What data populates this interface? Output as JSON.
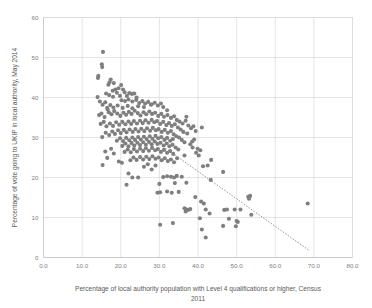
{
  "chart_data": {
    "type": "scatter",
    "title": "",
    "xlabel": "Percentage of local authority population with Level 4 qualifications or higher, Census 2011",
    "xlabel_line1": "Percentage of local authority population with Level 4 qualifications or higher, Census",
    "xlabel_line2": "2011",
    "ylabel": "Percentage of vote going to UKIP in local authority, May 2014",
    "xlim": [
      0,
      80
    ],
    "ylim": [
      0,
      60
    ],
    "xticks": [
      0,
      10,
      20,
      30,
      40,
      50,
      60,
      70,
      80
    ],
    "xtick_labels": [
      "0.0",
      "10.0",
      "20.0",
      "30.0",
      "40.0",
      "50.0",
      "60.0",
      "70.0",
      "80.0"
    ],
    "yticks": [
      0,
      10,
      20,
      30,
      40,
      50,
      60
    ],
    "ytick_labels": [
      "0",
      "10",
      "20",
      "30",
      "40",
      "50",
      "60"
    ],
    "grid": true,
    "legend": false,
    "marker_color": "#7f7f7f",
    "marker_size": 3.2,
    "trendline": {
      "style": "dotted",
      "color": "#808080",
      "x_start": 31.6,
      "y_start": 27.3,
      "x_end": 69.0,
      "y_end": 1.6
    },
    "series": [
      {
        "name": "Local authorities",
        "points": [
          [
            15.4,
            51.4
          ],
          [
            15.1,
            48.3
          ],
          [
            15.2,
            47.6
          ],
          [
            14.2,
            45.4
          ],
          [
            14.1,
            44.9
          ],
          [
            17.4,
            44.5
          ],
          [
            17.1,
            43.8
          ],
          [
            16.8,
            43.2
          ],
          [
            18.2,
            43.6
          ],
          [
            18.6,
            42.0
          ],
          [
            17.9,
            41.7
          ],
          [
            19.4,
            42.3
          ],
          [
            20.1,
            43.1
          ],
          [
            20.6,
            42.0
          ],
          [
            19.0,
            41.2
          ],
          [
            16.2,
            41.0
          ],
          [
            17.0,
            40.6
          ],
          [
            18.0,
            40.2
          ],
          [
            19.8,
            40.4
          ],
          [
            21.0,
            41.3
          ],
          [
            21.6,
            40.4
          ],
          [
            22.2,
            41.1
          ],
          [
            22.9,
            40.9
          ],
          [
            23.5,
            41.0
          ],
          [
            24.1,
            40.0
          ],
          [
            20.2,
            39.3
          ],
          [
            21.1,
            39.1
          ],
          [
            22.0,
            39.5
          ],
          [
            23.0,
            39.0
          ],
          [
            24.0,
            39.4
          ],
          [
            24.8,
            38.6
          ],
          [
            25.6,
            39.1
          ],
          [
            26.3,
            38.5
          ],
          [
            27.1,
            38.9
          ],
          [
            28.0,
            38.3
          ],
          [
            28.8,
            38.7
          ],
          [
            29.6,
            38.0
          ],
          [
            30.4,
            38.5
          ],
          [
            31.0,
            37.6
          ],
          [
            32.0,
            36.8
          ],
          [
            14.0,
            40.1
          ],
          [
            14.6,
            39.0
          ],
          [
            15.3,
            38.2
          ],
          [
            16.0,
            38.8
          ],
          [
            16.5,
            37.4
          ],
          [
            15.0,
            36.0
          ],
          [
            14.4,
            35.6
          ],
          [
            15.8,
            35.1
          ],
          [
            16.9,
            36.3
          ],
          [
            17.6,
            35.8
          ],
          [
            18.3,
            36.6
          ],
          [
            19.1,
            36.0
          ],
          [
            19.9,
            35.4
          ],
          [
            20.7,
            36.2
          ],
          [
            21.4,
            35.7
          ],
          [
            22.1,
            36.4
          ],
          [
            22.8,
            35.9
          ],
          [
            23.6,
            36.7
          ],
          [
            24.4,
            36.1
          ],
          [
            25.1,
            35.5
          ],
          [
            25.9,
            36.3
          ],
          [
            26.6,
            35.8
          ],
          [
            27.4,
            36.5
          ],
          [
            28.1,
            35.9
          ],
          [
            28.9,
            36.2
          ],
          [
            29.7,
            35.4
          ],
          [
            30.5,
            35.9
          ],
          [
            31.2,
            35.2
          ],
          [
            32.1,
            35.6
          ],
          [
            33.0,
            34.9
          ],
          [
            33.8,
            35.3
          ],
          [
            34.5,
            34.4
          ],
          [
            35.2,
            34.0
          ],
          [
            36.0,
            33.5
          ],
          [
            36.8,
            34.2
          ],
          [
            37.5,
            33.0
          ],
          [
            38.2,
            32.3
          ],
          [
            37.0,
            35.2
          ],
          [
            38.8,
            32.8
          ],
          [
            39.4,
            31.6
          ],
          [
            14.8,
            33.4
          ],
          [
            15.6,
            33.9
          ],
          [
            16.3,
            32.8
          ],
          [
            17.2,
            33.5
          ],
          [
            18.0,
            32.9
          ],
          [
            18.8,
            33.8
          ],
          [
            19.6,
            33.2
          ],
          [
            20.4,
            33.9
          ],
          [
            21.2,
            33.3
          ],
          [
            22.0,
            34.0
          ],
          [
            22.7,
            33.4
          ],
          [
            23.4,
            34.1
          ],
          [
            24.2,
            33.5
          ],
          [
            25.0,
            34.2
          ],
          [
            25.7,
            33.6
          ],
          [
            26.4,
            34.3
          ],
          [
            27.2,
            33.7
          ],
          [
            28.0,
            34.4
          ],
          [
            28.7,
            33.8
          ],
          [
            29.4,
            34.1
          ],
          [
            30.2,
            33.4
          ],
          [
            31.0,
            33.9
          ],
          [
            31.8,
            33.1
          ],
          [
            32.5,
            33.6
          ],
          [
            33.2,
            32.9
          ],
          [
            34.0,
            33.3
          ],
          [
            34.8,
            32.5
          ],
          [
            35.5,
            32.0
          ],
          [
            36.2,
            31.4
          ],
          [
            37.2,
            31.0
          ],
          [
            15.2,
            30.1
          ],
          [
            16.1,
            31.2
          ],
          [
            17.0,
            30.6
          ],
          [
            17.8,
            31.5
          ],
          [
            18.5,
            30.9
          ],
          [
            19.3,
            31.8
          ],
          [
            20.0,
            31.1
          ],
          [
            20.8,
            31.9
          ],
          [
            21.5,
            31.3
          ],
          [
            22.3,
            32.0
          ],
          [
            23.1,
            31.4
          ],
          [
            23.8,
            32.1
          ],
          [
            24.6,
            31.5
          ],
          [
            25.3,
            32.2
          ],
          [
            26.1,
            31.6
          ],
          [
            26.8,
            32.3
          ],
          [
            27.6,
            31.7
          ],
          [
            28.3,
            32.4
          ],
          [
            29.1,
            31.8
          ],
          [
            29.8,
            32.1
          ],
          [
            30.6,
            31.4
          ],
          [
            31.4,
            31.9
          ],
          [
            32.2,
            31.2
          ],
          [
            33.0,
            31.6
          ],
          [
            33.7,
            30.8
          ],
          [
            34.4,
            30.3
          ],
          [
            35.1,
            30.0
          ],
          [
            35.8,
            29.4
          ],
          [
            36.5,
            28.8
          ],
          [
            38.0,
            28.3
          ],
          [
            19.0,
            29.2
          ],
          [
            19.8,
            29.8
          ],
          [
            20.6,
            29.1
          ],
          [
            21.4,
            29.9
          ],
          [
            22.2,
            29.3
          ],
          [
            23.0,
            30.0
          ],
          [
            23.7,
            29.4
          ],
          [
            24.5,
            30.1
          ],
          [
            25.2,
            29.5
          ],
          [
            26.0,
            30.2
          ],
          [
            26.7,
            29.6
          ],
          [
            27.5,
            30.3
          ],
          [
            28.2,
            29.7
          ],
          [
            29.0,
            30.4
          ],
          [
            29.7,
            29.8
          ],
          [
            30.5,
            30.1
          ],
          [
            31.3,
            29.4
          ],
          [
            32.0,
            29.9
          ],
          [
            32.8,
            29.2
          ],
          [
            33.5,
            29.6
          ],
          [
            20.4,
            27.9
          ],
          [
            21.2,
            28.5
          ],
          [
            22.0,
            27.8
          ],
          [
            22.8,
            28.6
          ],
          [
            23.5,
            28.0
          ],
          [
            24.3,
            28.7
          ],
          [
            25.0,
            28.1
          ],
          [
            25.8,
            28.8
          ],
          [
            26.5,
            28.2
          ],
          [
            27.3,
            28.9
          ],
          [
            28.0,
            28.3
          ],
          [
            28.8,
            29.0
          ],
          [
            29.5,
            28.4
          ],
          [
            30.3,
            28.7
          ],
          [
            31.1,
            28.0
          ],
          [
            31.9,
            28.5
          ],
          [
            32.6,
            27.8
          ],
          [
            33.4,
            28.2
          ],
          [
            34.2,
            27.5
          ],
          [
            34.9,
            27.0
          ],
          [
            16.0,
            26.5
          ],
          [
            17.5,
            27.2
          ],
          [
            18.2,
            26.0
          ],
          [
            21.0,
            26.4
          ],
          [
            21.8,
            27.0
          ],
          [
            22.6,
            26.3
          ],
          [
            23.4,
            27.1
          ],
          [
            24.2,
            26.5
          ],
          [
            25.0,
            27.2
          ],
          [
            25.8,
            26.6
          ],
          [
            26.5,
            27.3
          ],
          [
            27.3,
            26.7
          ],
          [
            28.1,
            27.4
          ],
          [
            28.9,
            26.8
          ],
          [
            29.6,
            27.1
          ],
          [
            30.4,
            26.4
          ],
          [
            31.2,
            26.9
          ],
          [
            32.0,
            26.2
          ],
          [
            32.8,
            26.6
          ],
          [
            33.6,
            25.9
          ],
          [
            16.5,
            24.9
          ],
          [
            19.5,
            24.0
          ],
          [
            20.3,
            23.7
          ],
          [
            22.5,
            24.3
          ],
          [
            23.3,
            25.0
          ],
          [
            24.1,
            24.4
          ],
          [
            25.0,
            25.1
          ],
          [
            25.8,
            24.5
          ],
          [
            26.6,
            25.2
          ],
          [
            27.4,
            24.6
          ],
          [
            28.2,
            25.3
          ],
          [
            29.0,
            24.7
          ],
          [
            29.8,
            25.0
          ],
          [
            30.6,
            24.3
          ],
          [
            31.4,
            24.8
          ],
          [
            32.2,
            24.1
          ],
          [
            33.0,
            24.5
          ],
          [
            33.8,
            23.8
          ],
          [
            34.6,
            24.8
          ],
          [
            36.5,
            25.5
          ],
          [
            15.3,
            23.1
          ],
          [
            22.0,
            21.0
          ],
          [
            23.0,
            20.0
          ],
          [
            24.5,
            20.0
          ],
          [
            26.0,
            22.7
          ],
          [
            27.0,
            23.3
          ],
          [
            28.0,
            22.0
          ],
          [
            29.0,
            23.0
          ],
          [
            31.0,
            20.1
          ],
          [
            32.0,
            20.3
          ],
          [
            33.0,
            20.2
          ],
          [
            33.8,
            20.0
          ],
          [
            30.0,
            18.4
          ],
          [
            34.0,
            18.6
          ],
          [
            37.0,
            18.7
          ],
          [
            21.5,
            18.2
          ],
          [
            29.5,
            16.2
          ],
          [
            30.2,
            16.3
          ],
          [
            32.0,
            16.5
          ],
          [
            33.2,
            16.2
          ],
          [
            36.5,
            12.3
          ],
          [
            37.0,
            12.0
          ],
          [
            37.4,
            11.9
          ],
          [
            36.8,
            11.5
          ],
          [
            38.0,
            12.1
          ],
          [
            30.2,
            8.2
          ],
          [
            33.5,
            8.6
          ],
          [
            40.5,
            9.8
          ],
          [
            41.0,
            7.0
          ],
          [
            42.0,
            5.0
          ],
          [
            40.8,
            14.0
          ],
          [
            39.3,
            15.1
          ],
          [
            41.5,
            13.5
          ],
          [
            43.0,
            11.0
          ],
          [
            42.0,
            12.0
          ],
          [
            43.3,
            19.4
          ],
          [
            42.5,
            23.0
          ],
          [
            41.3,
            22.8
          ],
          [
            40.2,
            25.5
          ],
          [
            39.5,
            26.2
          ],
          [
            38.6,
            27.5
          ],
          [
            39.9,
            27.2
          ],
          [
            40.6,
            26.8
          ],
          [
            41.0,
            32.5
          ],
          [
            43.4,
            24.4
          ],
          [
            46.5,
            21.4
          ],
          [
            46.8,
            11.9
          ],
          [
            47.5,
            12.0
          ],
          [
            48.0,
            9.7
          ],
          [
            46.5,
            7.9
          ],
          [
            49.5,
            12.0
          ],
          [
            50.0,
            9.1
          ],
          [
            50.3,
            8.9
          ],
          [
            49.8,
            7.8
          ],
          [
            53.0,
            15.2
          ],
          [
            53.2,
            14.7
          ],
          [
            53.5,
            15.4
          ],
          [
            53.8,
            10.7
          ],
          [
            51.0,
            12.0
          ],
          [
            68.4,
            13.5
          ],
          [
            35.8,
            20.2
          ],
          [
            34.5,
            20.4
          ],
          [
            35.0,
            16.4
          ],
          [
            38.5,
            29.0
          ],
          [
            39.0,
            29.5
          ],
          [
            27.8,
            38.2
          ],
          [
            26.0,
            37.6
          ],
          [
            24.5,
            37.8
          ],
          [
            23.0,
            37.3
          ],
          [
            21.8,
            37.9
          ],
          [
            20.5,
            37.4
          ],
          [
            19.2,
            38.0
          ],
          [
            18.1,
            37.5
          ],
          [
            17.3,
            38.1
          ],
          [
            16.6,
            37.0
          ]
        ]
      }
    ]
  }
}
